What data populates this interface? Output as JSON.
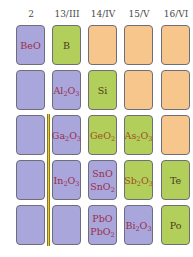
{
  "headers": [
    "2",
    "13/III",
    "14/IV",
    "15/V",
    "16/VI"
  ],
  "colors": {
    "purple": "#a9a6dc",
    "green": "#b1cf5a",
    "orange": "#f7c68c",
    "bar": "#e8c830"
  },
  "rows": [
    [
      {
        "c": "purple",
        "t": "BeO"
      },
      {
        "c": "green",
        "t": "B"
      },
      {
        "c": "orange",
        "t": ""
      },
      {
        "c": "orange",
        "t": ""
      },
      {
        "c": "orange",
        "t": ""
      }
    ],
    [
      {
        "c": "purple",
        "t": ""
      },
      {
        "c": "purple",
        "t": "Al2O3"
      },
      {
        "c": "green",
        "t": "Si"
      },
      {
        "c": "orange",
        "t": ""
      },
      {
        "c": "orange",
        "t": ""
      }
    ],
    [
      {
        "c": "purple",
        "t": ""
      },
      {
        "c": "purple",
        "t": "Ga2O3"
      },
      {
        "c": "green",
        "t": "GeO2"
      },
      {
        "c": "green",
        "t": "As2O3"
      },
      {
        "c": "orange",
        "t": ""
      }
    ],
    [
      {
        "c": "purple",
        "t": ""
      },
      {
        "c": "purple",
        "t": "In2O3"
      },
      {
        "c": "purple",
        "t": "SnO\nSnO2"
      },
      {
        "c": "green",
        "t": "Sb2O3"
      },
      {
        "c": "green",
        "t": "Te"
      }
    ],
    [
      {
        "c": "purple",
        "t": ""
      },
      {
        "c": "purple",
        "t": ""
      },
      {
        "c": "purple",
        "t": "PbO\nPbO2"
      },
      {
        "c": "purple",
        "t": "Bi2O3"
      },
      {
        "c": "green",
        "t": "Po"
      }
    ]
  ]
}
